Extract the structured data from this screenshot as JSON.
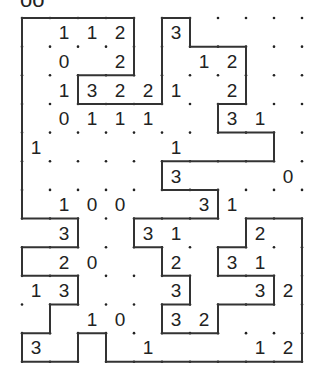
{
  "puzzle": {
    "type": "slitherlink",
    "clipped_title_fragment": "oo",
    "rows": 12,
    "cols": 10,
    "clues": [
      [
        null,
        1,
        1,
        2,
        null,
        3,
        null,
        null,
        null,
        null
      ],
      [
        null,
        0,
        null,
        2,
        null,
        null,
        1,
        2,
        null,
        null
      ],
      [
        null,
        1,
        3,
        2,
        2,
        1,
        null,
        2,
        null,
        null
      ],
      [
        null,
        0,
        1,
        1,
        1,
        null,
        null,
        3,
        1,
        null
      ],
      [
        1,
        null,
        null,
        null,
        null,
        1,
        null,
        null,
        null,
        null
      ],
      [
        null,
        null,
        null,
        null,
        null,
        3,
        null,
        null,
        null,
        0
      ],
      [
        null,
        1,
        0,
        0,
        null,
        null,
        3,
        1,
        null,
        null
      ],
      [
        null,
        3,
        null,
        null,
        3,
        1,
        null,
        null,
        2,
        null
      ],
      [
        null,
        2,
        0,
        null,
        null,
        2,
        null,
        3,
        1,
        null
      ],
      [
        1,
        3,
        null,
        null,
        null,
        3,
        null,
        null,
        3,
        2
      ],
      [
        null,
        null,
        1,
        0,
        null,
        3,
        2,
        null,
        null,
        null
      ],
      [
        3,
        null,
        null,
        null,
        1,
        null,
        null,
        null,
        1,
        2
      ]
    ],
    "loop_vertices": [
      [
        0,
        0
      ],
      [
        4,
        0
      ],
      [
        4,
        2
      ],
      [
        2,
        2
      ],
      [
        2,
        3
      ],
      [
        5,
        3
      ],
      [
        5,
        0
      ],
      [
        6,
        0
      ],
      [
        6,
        1
      ],
      [
        8,
        1
      ],
      [
        8,
        3
      ],
      [
        7,
        3
      ],
      [
        7,
        4
      ],
      [
        9,
        4
      ],
      [
        9,
        5
      ],
      [
        5,
        5
      ],
      [
        5,
        6
      ],
      [
        7,
        6
      ],
      [
        7,
        7
      ],
      [
        4,
        7
      ],
      [
        4,
        8
      ],
      [
        5,
        8
      ],
      [
        5,
        9
      ],
      [
        6,
        9
      ],
      [
        6,
        10
      ],
      [
        5,
        10
      ],
      [
        5,
        11
      ],
      [
        7,
        11
      ],
      [
        7,
        10
      ],
      [
        9,
        10
      ],
      [
        9,
        9
      ],
      [
        7,
        9
      ],
      [
        7,
        8
      ],
      [
        8,
        8
      ],
      [
        8,
        7
      ],
      [
        10,
        7
      ],
      [
        10,
        12
      ],
      [
        3,
        12
      ],
      [
        3,
        11
      ],
      [
        2,
        11
      ],
      [
        2,
        12
      ],
      [
        0,
        12
      ],
      [
        0,
        11
      ],
      [
        1,
        11
      ],
      [
        1,
        10
      ],
      [
        2,
        10
      ],
      [
        2,
        9
      ],
      [
        0,
        9
      ],
      [
        0,
        8
      ],
      [
        2,
        8
      ],
      [
        2,
        7
      ],
      [
        0,
        7
      ]
    ],
    "colors": {
      "line": "#333333",
      "dot": "#222222",
      "clue": "#222222",
      "background": "#ffffff"
    }
  }
}
